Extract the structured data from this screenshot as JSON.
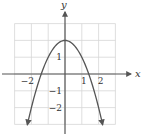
{
  "chart_data": {
    "type": "line",
    "title": "",
    "xlabel": "x",
    "ylabel": "y",
    "xlim": [
      -3,
      3
    ],
    "ylim": [
      -3,
      3
    ],
    "grid": true,
    "x_ticks": [
      {
        "value": -2,
        "label": "−2"
      },
      {
        "value": 1,
        "label": "1"
      },
      {
        "value": 2,
        "label": "2"
      }
    ],
    "y_ticks": [
      {
        "value": 1,
        "label": "1"
      },
      {
        "value": -1,
        "label": "−1"
      },
      {
        "value": -2,
        "label": "−2"
      }
    ],
    "series": [
      {
        "name": "f(x) = 2 − x²",
        "equation": "y = 2 - x^2",
        "x_range": [
          -2.24,
          2.24
        ],
        "points": [
          [
            -2.24,
            -3.0
          ],
          [
            -2.0,
            -2.0
          ],
          [
            -1.5,
            -0.25
          ],
          [
            -1.41,
            0.0
          ],
          [
            -1.0,
            1.0
          ],
          [
            -0.5,
            1.75
          ],
          [
            0.0,
            2.0
          ],
          [
            0.5,
            1.75
          ],
          [
            1.0,
            1.0
          ],
          [
            1.41,
            0.0
          ],
          [
            1.5,
            -0.25
          ],
          [
            2.0,
            -2.0
          ],
          [
            2.24,
            -3.0
          ]
        ],
        "arrows_at_ends": true,
        "color": "#555555"
      }
    ]
  }
}
